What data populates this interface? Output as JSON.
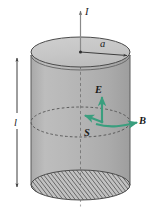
{
  "labels": {
    "current": "I",
    "radius": "a",
    "length": "l",
    "electric_field": "E",
    "magnetic_field": "B",
    "poynting_vector": "S"
  },
  "geometry": {
    "cylinder_left_x": 31,
    "cylinder_right_x": 130,
    "top_ellipse_cy": 55,
    "bottom_ellipse_cy": 185,
    "ellipse_rx": 49.5,
    "ellipse_ry": 15,
    "mid_ellipse_cy": 122,
    "axis_x": 80.5,
    "axis_top_y": 9,
    "axis_bottom_y": 208,
    "length_arrow_x": 17,
    "length_arrow_top_y": 58,
    "length_arrow_bottom_y": 187
  },
  "colors": {
    "vector_green": "#3a9e7e",
    "cylinder_body": "#b4b4b4",
    "cylinder_top": "#c9c9c9",
    "outline": "#4d4d4d",
    "label_text": "#1a1a1a",
    "axis_line": "#8a8a8a",
    "hatch_line": "#3f3f3f",
    "background": "#ffffff"
  },
  "elements": {
    "current_axis_name": "current-axis",
    "radius_arrow_name": "radius-arrow",
    "length_arrow_name": "length-arrow",
    "top_cap_name": "cylinder-top-cap",
    "bottom_cap_name": "cylinder-bottom-cap-hatched",
    "mid_ring_name": "cylinder-mid-ring-dashed",
    "body_name": "cylinder-body"
  }
}
